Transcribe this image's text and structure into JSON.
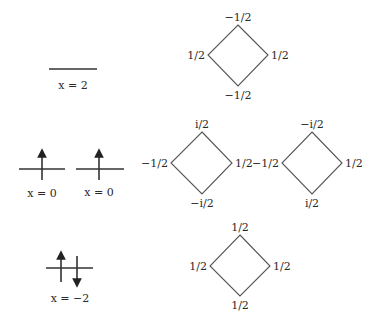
{
  "levels": [
    {
      "label": "x = 2",
      "occupancy": "empty"
    },
    {
      "label": "x = 0",
      "occupancy": "single-up"
    },
    {
      "label": "x = 0",
      "occupancy": "single-up"
    },
    {
      "label": "x = −2",
      "occupancy": "up-down-pair"
    }
  ],
  "diamonds": [
    {
      "top": "−1/2",
      "left": "1/2",
      "right": "1/2",
      "bottom": "−1/2"
    },
    {
      "top": "i/2",
      "left": "−1/2",
      "right": "1/2",
      "bottom": "−i/2"
    },
    {
      "top": "−i/2",
      "left": "−1/2",
      "right": "1/2",
      "bottom": "i/2"
    },
    {
      "top": "1/2",
      "left": "1/2",
      "right": "1/2",
      "bottom": "1/2"
    }
  ],
  "colors": {
    "line": "#333333",
    "diamond": "#555555",
    "text": "#2a2a2a"
  }
}
